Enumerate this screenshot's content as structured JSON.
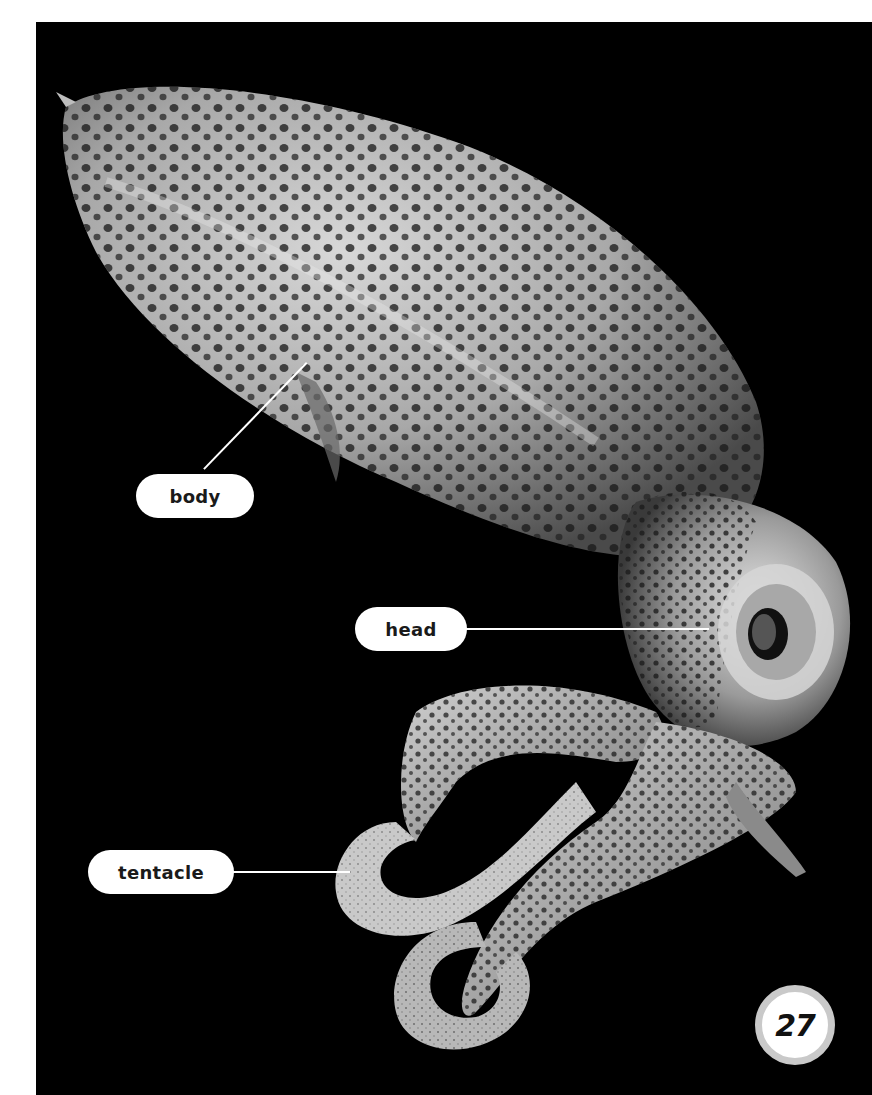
{
  "page": {
    "number": "27",
    "background": "#000000",
    "margin_color": "#ffffff"
  },
  "photo": {
    "subject": "squid",
    "description": "Spotted squid on black background"
  },
  "labels": [
    {
      "id": "body",
      "text": "body"
    },
    {
      "id": "head",
      "text": "head"
    },
    {
      "id": "tentacle",
      "text": "tentacle"
    }
  ]
}
